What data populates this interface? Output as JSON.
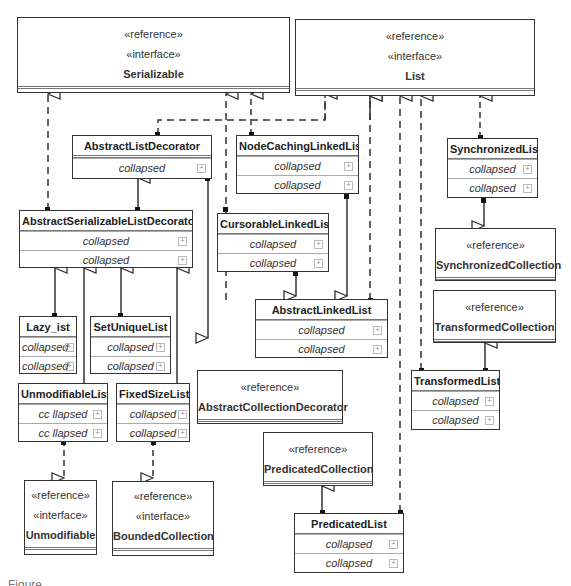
{
  "diagram": {
    "type": "UML class diagram",
    "interfaces": [
      {
        "id": "serializable",
        "stereotypes": [
          "«reference»",
          "«interface»"
        ],
        "name": "Serializable"
      },
      {
        "id": "list",
        "stereotypes": [
          "«reference»",
          "«interface»"
        ],
        "name": "List"
      },
      {
        "id": "unmodifiable",
        "stereotypes": [
          "«reference»",
          "«interface»"
        ],
        "name": "Unmodifiable"
      },
      {
        "id": "bounded",
        "stereotypes": [
          "«reference»",
          "«interface»"
        ],
        "name": "BoundedCollection"
      }
    ],
    "references": [
      {
        "id": "synccoll",
        "stereotype": "«reference»",
        "name": "SynchronizedCollection"
      },
      {
        "id": "transcoll",
        "stereotype": "«reference»",
        "name": "TransformedCollection"
      },
      {
        "id": "abscolldec",
        "stereotype": "«reference»",
        "name": "AbstractCollectionDecorator"
      },
      {
        "id": "predcoll",
        "stereotype": "«reference»",
        "name": "PredicatedCollection"
      }
    ],
    "classes": [
      {
        "id": "absListDec",
        "name": "AbstractListDecorator",
        "compartments": [
          "collapsed"
        ]
      },
      {
        "id": "nodeCaching",
        "name": "NodeCachingLinkedList",
        "compartments": [
          "collapsed",
          "collapsed"
        ]
      },
      {
        "id": "syncList",
        "name": "SynchronizedList",
        "compartments": [
          "collapsed",
          "collapsed"
        ]
      },
      {
        "id": "absSerListDec",
        "name": "AbstractSerializableListDecorator",
        "compartments": [
          "collapsed",
          "collapsed"
        ]
      },
      {
        "id": "cursorable",
        "name": "CursorableLinkedList",
        "compartments": [
          "collapsed",
          "collapsed"
        ]
      },
      {
        "id": "absLinked",
        "name": "AbstractLinkedList",
        "compartments": [
          "collapsed",
          "collapsed"
        ]
      },
      {
        "id": "lazyList",
        "name": "Lazy_ist",
        "compartments": [
          "collapsed",
          "collapsed"
        ]
      },
      {
        "id": "setUnique",
        "name": "SetUniqueList",
        "compartments": [
          "collapsed",
          "collapsed"
        ]
      },
      {
        "id": "unmodList",
        "name": "UnmodifiableList",
        "compartments": [
          "cc llapsed",
          "cc llapsed"
        ]
      },
      {
        "id": "fixedSize",
        "name": "FixedSizeList",
        "compartments": [
          "collapsed",
          "collapsed"
        ]
      },
      {
        "id": "transList",
        "name": "TransformedList",
        "compartments": [
          "collapsed",
          "collapsed"
        ]
      },
      {
        "id": "predList",
        "name": "PredicatedList",
        "compartments": [
          "collapsed",
          "collapsed"
        ]
      }
    ],
    "expand_icon": "+",
    "caption": "Figure ..."
  }
}
